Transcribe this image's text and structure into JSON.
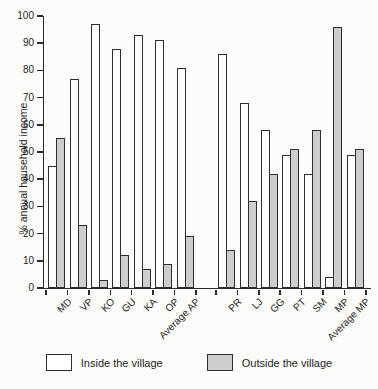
{
  "figure": {
    "background": "#fcfcfa",
    "axis_color": "#2b2b2b",
    "bar_outline": "#2e2e2e",
    "inside_fill": "#ffffff",
    "outside_fill": "#cdcdcb"
  },
  "chart_data": {
    "type": "bar",
    "title": "",
    "xlabel": "",
    "ylabel": "% annual household income",
    "ylim": [
      0,
      100
    ],
    "yticks": [
      0,
      10,
      20,
      30,
      40,
      50,
      60,
      70,
      80,
      90,
      100
    ],
    "grid": false,
    "legend_position": "bottom",
    "categories": [
      "MD",
      "VP",
      "KO",
      "GU",
      "KA",
      "OP",
      "Average AP",
      "PR",
      "LJ",
      "GG",
      "PT",
      "SM",
      "MP",
      "Average MP"
    ],
    "group_gap_after_index": 6,
    "series": [
      {
        "name": "Inside the village",
        "values": [
          45,
          77,
          97,
          88,
          93,
          91,
          81,
          86,
          68,
          58,
          49,
          42,
          4,
          49
        ]
      },
      {
        "name": "Outside the village",
        "values": [
          55,
          23,
          3,
          12,
          7,
          9,
          19,
          14,
          32,
          42,
          51,
          58,
          96,
          51
        ]
      }
    ]
  }
}
